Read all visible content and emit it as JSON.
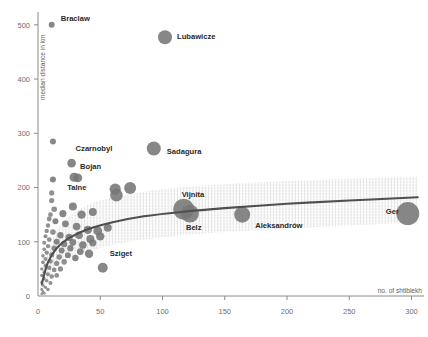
{
  "chart_data": {
    "type": "scatter",
    "title": "",
    "subtitle": "",
    "xlabel": "no. of shtiblekh",
    "ylabel": "median distance in km",
    "xlim": [
      0,
      310
    ],
    "ylim": [
      0,
      520
    ],
    "xticks": [
      0,
      50,
      100,
      150,
      200,
      250,
      300
    ],
    "yticks": [
      0,
      100,
      200,
      300,
      400,
      500
    ],
    "grid": false,
    "legend": null,
    "size_encoding": "bubble area proportional to no. of shtiblekh",
    "annotations": [
      {
        "label": "Braclaw",
        "x": 11,
        "y": 500,
        "size": 3.0
      },
      {
        "label": "Lubawicze",
        "x": 102,
        "y": 477,
        "size": 7.0
      },
      {
        "label": "Czarnobyl",
        "x": 27,
        "y": 245,
        "size": 4.3
      },
      {
        "label": "Sadagura",
        "x": 93,
        "y": 272,
        "size": 7.0
      },
      {
        "label": "Bojan",
        "x": 29,
        "y": 218,
        "size": 4.6
      },
      {
        "label": "Talne",
        "x": 25,
        "y": 215,
        "size": 4.2
      },
      {
        "label": "Vijnita",
        "x": 117,
        "y": 160,
        "size": 10.5
      },
      {
        "label": "Belz",
        "x": 122,
        "y": 152,
        "size": 9.0
      },
      {
        "label": "Aleksandrów",
        "x": 164,
        "y": 150,
        "size": 8.0
      },
      {
        "label": "Ger",
        "x": 297,
        "y": 152,
        "size": 11.5
      },
      {
        "label": "Sziget",
        "x": 52,
        "y": 52,
        "size": 5.0
      }
    ],
    "points": [
      {
        "x": 11,
        "y": 500,
        "size": 3.0
      },
      {
        "x": 102,
        "y": 477,
        "size": 7.0
      },
      {
        "x": 12,
        "y": 285,
        "size": 3.0
      },
      {
        "x": 93,
        "y": 272,
        "size": 7.0
      },
      {
        "x": 27,
        "y": 245,
        "size": 4.3
      },
      {
        "x": 29,
        "y": 219,
        "size": 4.6
      },
      {
        "x": 32,
        "y": 218,
        "size": 4.4
      },
      {
        "x": 12,
        "y": 215,
        "size": 3.0
      },
      {
        "x": 62,
        "y": 197,
        "size": 5.6
      },
      {
        "x": 74,
        "y": 199,
        "size": 6.0
      },
      {
        "x": 63,
        "y": 186,
        "size": 6.3
      },
      {
        "x": 11,
        "y": 190,
        "size": 2.6
      },
      {
        "x": 11,
        "y": 176,
        "size": 2.6
      },
      {
        "x": 28,
        "y": 165,
        "size": 4.0
      },
      {
        "x": 117,
        "y": 160,
        "size": 10.5
      },
      {
        "x": 122,
        "y": 152,
        "size": 9.0
      },
      {
        "x": 164,
        "y": 150,
        "size": 8.0
      },
      {
        "x": 297,
        "y": 152,
        "size": 11.5
      },
      {
        "x": 20,
        "y": 152,
        "size": 3.6
      },
      {
        "x": 35,
        "y": 150,
        "size": 4.2
      },
      {
        "x": 44,
        "y": 155,
        "size": 4.0
      },
      {
        "x": 13,
        "y": 160,
        "size": 2.8
      },
      {
        "x": 10,
        "y": 150,
        "size": 2.4
      },
      {
        "x": 9,
        "y": 142,
        "size": 2.4
      },
      {
        "x": 14,
        "y": 138,
        "size": 3.0
      },
      {
        "x": 22,
        "y": 133,
        "size": 3.4
      },
      {
        "x": 31,
        "y": 128,
        "size": 3.8
      },
      {
        "x": 40,
        "y": 122,
        "size": 4.2
      },
      {
        "x": 48,
        "y": 120,
        "size": 4.4
      },
      {
        "x": 56,
        "y": 126,
        "size": 4.0
      },
      {
        "x": 8,
        "y": 130,
        "size": 2.2
      },
      {
        "x": 7,
        "y": 120,
        "size": 2.2
      },
      {
        "x": 12,
        "y": 118,
        "size": 2.8
      },
      {
        "x": 18,
        "y": 112,
        "size": 3.2
      },
      {
        "x": 25,
        "y": 108,
        "size": 3.6
      },
      {
        "x": 33,
        "y": 112,
        "size": 3.8
      },
      {
        "x": 42,
        "y": 105,
        "size": 4.0
      },
      {
        "x": 50,
        "y": 110,
        "size": 4.2
      },
      {
        "x": 6,
        "y": 110,
        "size": 2.0
      },
      {
        "x": 9,
        "y": 104,
        "size": 2.4
      },
      {
        "x": 15,
        "y": 100,
        "size": 3.0
      },
      {
        "x": 21,
        "y": 96,
        "size": 3.2
      },
      {
        "x": 28,
        "y": 99,
        "size": 3.4
      },
      {
        "x": 36,
        "y": 94,
        "size": 3.8
      },
      {
        "x": 44,
        "y": 98,
        "size": 3.6
      },
      {
        "x": 5,
        "y": 98,
        "size": 2.0
      },
      {
        "x": 8,
        "y": 92,
        "size": 2.2
      },
      {
        "x": 13,
        "y": 88,
        "size": 2.8
      },
      {
        "x": 19,
        "y": 84,
        "size": 3.0
      },
      {
        "x": 26,
        "y": 88,
        "size": 3.2
      },
      {
        "x": 34,
        "y": 82,
        "size": 3.4
      },
      {
        "x": 41,
        "y": 78,
        "size": 4.2
      },
      {
        "x": 5,
        "y": 86,
        "size": 1.8
      },
      {
        "x": 7,
        "y": 80,
        "size": 2.2
      },
      {
        "x": 11,
        "y": 76,
        "size": 2.6
      },
      {
        "x": 17,
        "y": 72,
        "size": 2.8
      },
      {
        "x": 24,
        "y": 75,
        "size": 3.0
      },
      {
        "x": 30,
        "y": 70,
        "size": 3.2
      },
      {
        "x": 4,
        "y": 74,
        "size": 1.8
      },
      {
        "x": 6,
        "y": 68,
        "size": 2.0
      },
      {
        "x": 10,
        "y": 64,
        "size": 2.4
      },
      {
        "x": 15,
        "y": 60,
        "size": 2.6
      },
      {
        "x": 21,
        "y": 63,
        "size": 2.8
      },
      {
        "x": 52,
        "y": 52,
        "size": 5.0
      },
      {
        "x": 4,
        "y": 62,
        "size": 1.8
      },
      {
        "x": 6,
        "y": 56,
        "size": 2.0
      },
      {
        "x": 9,
        "y": 52,
        "size": 2.2
      },
      {
        "x": 13,
        "y": 48,
        "size": 2.4
      },
      {
        "x": 18,
        "y": 50,
        "size": 2.6
      },
      {
        "x": 3,
        "y": 50,
        "size": 1.6
      },
      {
        "x": 5,
        "y": 44,
        "size": 1.8
      },
      {
        "x": 8,
        "y": 40,
        "size": 2.0
      },
      {
        "x": 11,
        "y": 36,
        "size": 2.2
      },
      {
        "x": 15,
        "y": 38,
        "size": 2.4
      },
      {
        "x": 3,
        "y": 38,
        "size": 1.6
      },
      {
        "x": 5,
        "y": 32,
        "size": 1.6
      },
      {
        "x": 7,
        "y": 28,
        "size": 1.8
      },
      {
        "x": 10,
        "y": 24,
        "size": 2.0
      },
      {
        "x": 3,
        "y": 26,
        "size": 1.5
      },
      {
        "x": 4,
        "y": 20,
        "size": 1.5
      },
      {
        "x": 6,
        "y": 16,
        "size": 1.6
      },
      {
        "x": 8,
        "y": 12,
        "size": 1.8
      },
      {
        "x": 3,
        "y": 12,
        "size": 1.4
      },
      {
        "x": 4,
        "y": 8,
        "size": 1.4
      },
      {
        "x": 5,
        "y": 5,
        "size": 1.4
      },
      {
        "x": 3,
        "y": 4,
        "size": 1.3
      }
    ],
    "trend_line": {
      "description": "fitted curve (log-like), rising from ~30 km at x=3 to ~180 km at x=305",
      "points": [
        {
          "x": 3,
          "y": 22
        },
        {
          "x": 8,
          "y": 62
        },
        {
          "x": 15,
          "y": 88
        },
        {
          "x": 25,
          "y": 107
        },
        {
          "x": 40,
          "y": 123
        },
        {
          "x": 60,
          "y": 136
        },
        {
          "x": 85,
          "y": 147
        },
        {
          "x": 115,
          "y": 155
        },
        {
          "x": 150,
          "y": 162
        },
        {
          "x": 200,
          "y": 170
        },
        {
          "x": 250,
          "y": 176
        },
        {
          "x": 305,
          "y": 182
        }
      ]
    },
    "confidence_band": {
      "style": "dithered / hatched grey texture",
      "upper": [
        {
          "x": 3,
          "y": 40
        },
        {
          "x": 15,
          "y": 120
        },
        {
          "x": 40,
          "y": 168
        },
        {
          "x": 85,
          "y": 192
        },
        {
          "x": 150,
          "y": 206
        },
        {
          "x": 250,
          "y": 216
        },
        {
          "x": 305,
          "y": 220
        }
      ],
      "lower": [
        {
          "x": 3,
          "y": 5
        },
        {
          "x": 15,
          "y": 55
        },
        {
          "x": 40,
          "y": 82
        },
        {
          "x": 85,
          "y": 104
        },
        {
          "x": 150,
          "y": 118
        },
        {
          "x": 250,
          "y": 130
        },
        {
          "x": 305,
          "y": 136
        }
      ]
    }
  },
  "colors": {
    "point": "#767676",
    "trend": "#4f4f4f",
    "band": "#c2c2c2",
    "axis": "#8a8a8a",
    "tick_text": "#6e6e6e",
    "label_text": "#2a2a2a",
    "background": "#ffffff"
  }
}
